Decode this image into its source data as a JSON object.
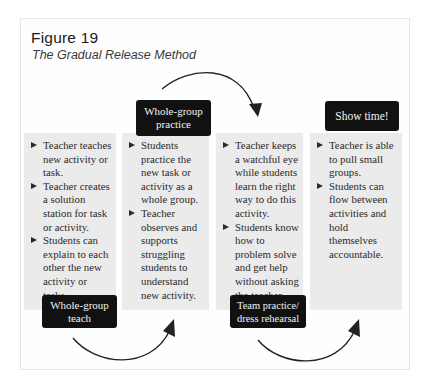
{
  "figure": {
    "number": "Figure 19",
    "title": "The Gradual Release Method"
  },
  "stages": [
    {
      "label": "Whole-group teach",
      "label_lines": [
        "Whole-group",
        "teach"
      ],
      "bullets": [
        "Teacher teaches new activity or task.",
        "Teacher creates a solution station for task or activity.",
        "Students can explain to each other the new activity or tasks."
      ]
    },
    {
      "label": "Whole-group practice",
      "label_lines": [
        "Whole-group",
        "practice"
      ],
      "bullets": [
        "Students practice the new task or activity as a whole group.",
        "Teacher observes and supports struggling students to understand new activity."
      ]
    },
    {
      "label": "Team practice/ dress rehearsal",
      "label_lines": [
        "Team practice/",
        "dress rehearsal"
      ],
      "bullets": [
        "Teacher keeps a watchful eye while students learn the right way to do this activity.",
        "Students know how to problem solve and get help without asking the teacher."
      ]
    },
    {
      "label": "Show time!",
      "label_lines": [
        "Show time!"
      ],
      "bullets": [
        "Teacher is able to pull small groups.",
        "Students can flow between activities and hold themselves accountable."
      ]
    }
  ],
  "colors": {
    "box_fill": "#ebebeb",
    "label_fill": "#111111",
    "label_text": "#f2f2f2",
    "arrow": "#222222"
  }
}
